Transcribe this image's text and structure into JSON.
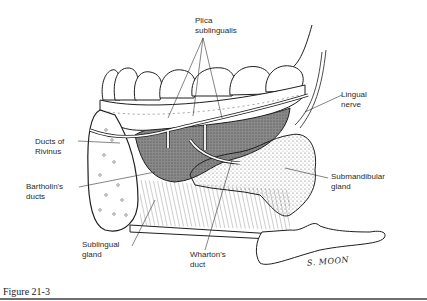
{
  "figure": {
    "caption": "Figure 21-3",
    "signature": "S. MOON",
    "labels": {
      "plica_sublingualis": "Plica\nsublingualis",
      "lingual_nerve": "Lingual\nnerve",
      "ducts_of_rivinus": "Ducts of\nRivinus",
      "bartholins_ducts": "Bartholin's\nducts",
      "submandibular_gland": "Submandibular\ngland",
      "sublingual_gland": "Sublingual\ngland",
      "whartons_duct": "Wharton's\nduct"
    },
    "colors": {
      "line": "#1e1e1e",
      "gland_shade": "#8a8a8a",
      "stipple": "#444444",
      "caption_rule": "#6f6f6f"
    }
  }
}
